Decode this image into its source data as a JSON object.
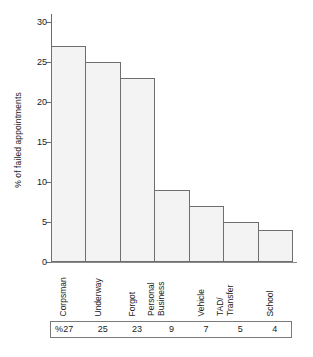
{
  "chart_data": {
    "type": "bar",
    "title": "",
    "xlabel": "",
    "ylabel": "% of failed appointments",
    "ylim": [
      0,
      31
    ],
    "yticks": [
      0,
      5,
      10,
      15,
      20,
      25,
      30
    ],
    "ytick_labels": [
      "0",
      "5",
      "10",
      "15",
      "20",
      "25",
      "30"
    ],
    "grid": false,
    "legend": "none",
    "bar_fill": "#f3f3f3",
    "bar_edge": "#6e6e6e",
    "categories": [
      "Corpsman",
      "Underway",
      "Forgot",
      "Personal Business",
      "Vehicle",
      "TAD/ Transfer",
      "School"
    ],
    "category_lines": [
      [
        "Corpsman"
      ],
      [
        "Underway"
      ],
      [
        "Forgot"
      ],
      [
        "Personal",
        "Business"
      ],
      [
        "Vehicle"
      ],
      [
        "TAD/",
        "Transfer"
      ],
      [
        "School"
      ]
    ],
    "values": [
      27,
      25,
      23,
      9,
      7,
      5,
      4
    ]
  },
  "table": {
    "unit_symbol": "%",
    "values": [
      "27",
      "25",
      "23",
      "9",
      "7",
      "5",
      "4"
    ]
  }
}
